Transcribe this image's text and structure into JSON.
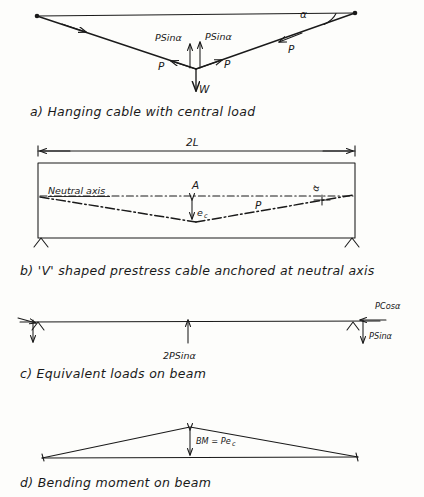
{
  "document": {
    "title": "Prestressed concrete beam - V shaped cable analysis",
    "ink_color": "#1a1a1a",
    "paper_color": "#fdfdfb"
  },
  "figures": [
    {
      "id": "a",
      "caption": "a) Hanging cable with central load",
      "labels": {
        "left_tension": "P",
        "right_tension": "P",
        "right_side_tension": "P",
        "vertical_left": "PSinα",
        "vertical_right": "PSinα",
        "central_load": "W",
        "angle": "α"
      }
    },
    {
      "id": "b",
      "caption": "b) 'V' shaped prestress cable anchored at neutral axis",
      "labels": {
        "span_dimension": "2L",
        "neutral_axis": "Neutral axis",
        "point_a": "A",
        "eccentricity": "e",
        "eccentricity_sub": "c",
        "cable_force": "P",
        "angle": "α"
      }
    },
    {
      "id": "c",
      "caption": "c) Equivalent loads on beam",
      "labels": {
        "central_uplift": "2PSinα",
        "horizontal_right": "PCosα",
        "vertical_right": "PSinα"
      }
    },
    {
      "id": "d",
      "caption": "d) Bending moment on beam",
      "labels": {
        "moment_value": "BM = Pe",
        "moment_value_sub": "c"
      }
    }
  ]
}
